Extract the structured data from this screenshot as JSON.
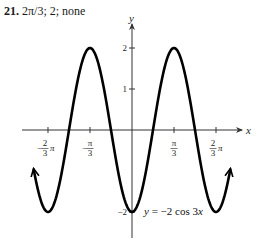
{
  "header": {
    "problem_number": "21.",
    "answer_text": "2π/3; 2; none"
  },
  "chart_data": {
    "type": "line",
    "title": "",
    "function_label": "y = −2 cos 3x",
    "xlabel": "x",
    "ylabel": "y",
    "xlim": [
      -2.5,
      2.5
    ],
    "ylim": [
      -2.6,
      2.8
    ],
    "x_ticks": [
      {
        "value": -2.0944,
        "label_num": "2",
        "label_den": "3",
        "label_sign": "−",
        "label_suffix": "π"
      },
      {
        "value": -1.0472,
        "label_num": "π",
        "label_den": "3",
        "label_sign": "−",
        "label_suffix": ""
      },
      {
        "value": 1.0472,
        "label_num": "π",
        "label_den": "3",
        "label_sign": "",
        "label_suffix": ""
      },
      {
        "value": 2.0944,
        "label_num": "2",
        "label_den": "3",
        "label_sign": "",
        "label_suffix": "π"
      }
    ],
    "y_ticks": [
      {
        "value": 2,
        "label": "2"
      },
      {
        "value": 1,
        "label": "1"
      },
      {
        "value": -2,
        "label": "−2"
      }
    ],
    "series": [
      {
        "name": "y = -2cos(3x)",
        "amplitude": -2,
        "frequency": 3,
        "x_range": [
          -2.45,
          2.45
        ],
        "arrows": "both"
      }
    ],
    "grid": false,
    "colors": {
      "curve": "#000000",
      "axis": "#333333"
    }
  }
}
